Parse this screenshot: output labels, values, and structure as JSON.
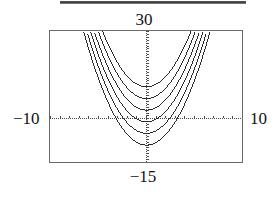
{
  "figure": {
    "name": "graphing-calculator-parabola-family",
    "top_rule": true
  },
  "labels": {
    "top": "30",
    "bottom": "−15",
    "left": "−10",
    "right": "10"
  },
  "chart_data": {
    "type": "line",
    "title": "",
    "subtitle": "",
    "xlabel": "",
    "ylabel": "",
    "xlim": [
      -10,
      10
    ],
    "ylim": [
      -15,
      30
    ],
    "xlim_label_left": "−10",
    "xlim_label_right": "10",
    "ylim_label_top": "30",
    "ylim_label_bottom": "−15",
    "grid": false,
    "legend": "none",
    "axes_style": "calculator-screen-with-tick-marks",
    "x_tick_spacing": 1,
    "y_tick_spacing": 1,
    "line_style": "dotted-pixelated",
    "line_color": "#2b2b2b",
    "series": [
      {
        "name": "y = 0.9x^2 + 11",
        "a": 0.9,
        "h": 0.0,
        "k": 11,
        "x": [
          -6.0,
          -5.0,
          -4.0,
          -3.0,
          -2.0,
          -1.0,
          0.0,
          1.0,
          2.0,
          3.0,
          4.0,
          5.0,
          6.0
        ],
        "values": [
          43.4,
          33.5,
          25.4,
          19.1,
          14.6,
          11.9,
          11.0,
          11.9,
          14.6,
          19.1,
          25.4,
          33.5,
          43.4
        ]
      },
      {
        "name": "y = 0.9x^2 + 7",
        "a": 0.9,
        "h": 0.0,
        "k": 7,
        "x": [
          -6.0,
          -5.0,
          -4.0,
          -3.0,
          -2.0,
          -1.0,
          0.0,
          1.0,
          2.0,
          3.0,
          4.0,
          5.0,
          6.0
        ],
        "values": [
          39.4,
          29.5,
          21.4,
          15.1,
          10.6,
          7.9,
          7.0,
          7.9,
          10.6,
          15.1,
          21.4,
          29.5,
          39.4
        ]
      },
      {
        "name": "y = 0.9x^2 + 3",
        "a": 0.9,
        "h": 0.0,
        "k": 3,
        "x": [
          -6.0,
          -5.0,
          -4.0,
          -3.0,
          -2.0,
          -1.0,
          0.0,
          1.0,
          2.0,
          3.0,
          4.0,
          5.0,
          6.0
        ],
        "values": [
          35.4,
          25.5,
          17.4,
          11.1,
          6.6,
          3.9,
          3.0,
          3.9,
          6.6,
          11.1,
          17.4,
          25.5,
          35.4
        ]
      },
      {
        "name": "y = 0.9x^2 - 1",
        "a": 0.9,
        "h": 0.0,
        "k": -1,
        "x": [
          -6.0,
          -5.0,
          -4.0,
          -3.0,
          -2.0,
          -1.0,
          0.0,
          1.0,
          2.0,
          3.0,
          4.0,
          5.0,
          6.0
        ],
        "values": [
          31.4,
          21.5,
          13.4,
          7.1,
          2.6,
          -0.1,
          -1.0,
          -0.1,
          2.6,
          7.1,
          13.4,
          21.5,
          31.4
        ]
      },
      {
        "name": "y = 0.9x^2 - 5",
        "a": 0.9,
        "h": 0.0,
        "k": -5,
        "x": [
          -6.0,
          -5.0,
          -4.0,
          -3.0,
          -2.0,
          -1.0,
          0.0,
          1.0,
          2.0,
          3.0,
          4.0,
          5.0,
          6.0
        ],
        "values": [
          27.4,
          17.5,
          9.4,
          3.1,
          -1.4,
          -4.1,
          -5.0,
          -4.1,
          -1.4,
          3.1,
          9.4,
          17.5,
          27.4
        ]
      },
      {
        "name": "y = 0.9x^2 - 9",
        "a": 0.9,
        "h": 0.0,
        "k": -9,
        "x": [
          -6.0,
          -5.0,
          -4.0,
          -3.0,
          -2.0,
          -1.0,
          0.0,
          1.0,
          2.0,
          3.0,
          4.0,
          5.0,
          6.0
        ],
        "values": [
          23.4,
          13.5,
          5.4,
          -0.9,
          -5.4,
          -8.1,
          -9.0,
          -8.1,
          -5.4,
          -0.9,
          5.4,
          13.5,
          23.4
        ]
      }
    ]
  }
}
